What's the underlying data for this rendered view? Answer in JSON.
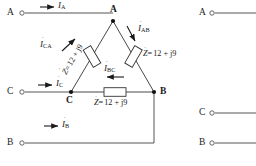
{
  "figure": {
    "type": "delta-connected-three-phase-load-circuit",
    "impedance_value": "12 + j9"
  },
  "left_terminals": [
    {
      "id": "A",
      "label": "A",
      "y": 13
    },
    {
      "id": "C",
      "label": "C",
      "y": 92
    },
    {
      "id": "B",
      "label": "B",
      "y": 143
    }
  ],
  "right_terminals": [
    {
      "id": "A",
      "label": "A",
      "y": 13
    },
    {
      "id": "C",
      "label": "C",
      "y": 113
    },
    {
      "id": "B",
      "label": "B",
      "y": 143
    }
  ],
  "nodes": [
    {
      "id": "A",
      "label": "A"
    },
    {
      "id": "B",
      "label": "B"
    },
    {
      "id": "C",
      "label": "C"
    }
  ],
  "line_currents": [
    {
      "id": "IA",
      "symbol": "I",
      "subscript": "A",
      "dot": true
    },
    {
      "id": "IC",
      "symbol": "I",
      "subscript": "C",
      "dot": true
    },
    {
      "id": "IB",
      "symbol": "I",
      "subscript": "B",
      "dot": true
    }
  ],
  "phase_currents": [
    {
      "id": "ICA",
      "symbol": "I",
      "subscript": "CA",
      "dot": true
    },
    {
      "id": "IAB",
      "symbol": "I",
      "subscript": "AB",
      "dot": true
    },
    {
      "id": "IBC",
      "symbol": "I",
      "subscript": "BC",
      "dot": true
    }
  ],
  "impedances": [
    {
      "id": "Z-CA",
      "symbol": "Z",
      "dot": true,
      "equals": "=",
      "value": "12 + j9",
      "text": "Z = 12 + j9"
    },
    {
      "id": "Z-AB",
      "symbol": "Z",
      "dot": true,
      "equals": "=",
      "value": "12 + j9",
      "text": "Z = 12 + j9"
    },
    {
      "id": "Z-BC",
      "symbol": "Z",
      "dot": true,
      "equals": "=",
      "value": "12 + j9",
      "text": "Z = 12 + j9"
    }
  ],
  "colors": {
    "ink": "#1a1a1a",
    "wire": "#555555",
    "background": "#ffffff"
  }
}
